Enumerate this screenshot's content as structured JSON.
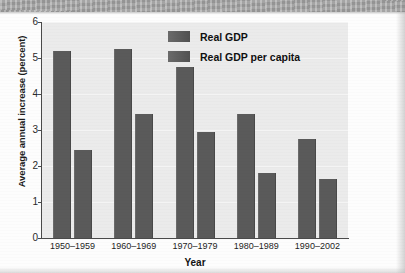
{
  "chart_data": {
    "type": "bar",
    "title": "",
    "xlabel": "Year",
    "ylabel": "Average annual increase (percent)",
    "categories": [
      "1950–1959",
      "1960–1969",
      "1970–1979",
      "1980–1989",
      "1990–2002"
    ],
    "series": [
      {
        "name": "Real GDP",
        "values": [
          5.2,
          5.25,
          4.75,
          3.45,
          2.75
        ],
        "color": "#5a5a5a"
      },
      {
        "name": "Real GDP per capita",
        "values": [
          2.45,
          3.45,
          2.95,
          1.8,
          1.65
        ],
        "color": "#5a5a5a"
      }
    ],
    "ylim": [
      0,
      6
    ],
    "ytick_labels": [
      "6",
      "5",
      "4",
      "3",
      "2",
      "1",
      "0"
    ],
    "ytick_values": [
      6,
      5,
      4,
      3,
      2,
      1,
      0
    ],
    "grid": true,
    "legend_position": "top-center"
  },
  "legend": {
    "entries": [
      {
        "label": "Real GDP"
      },
      {
        "label": "Real GDP per capita"
      }
    ]
  },
  "axes": {
    "y_title": "Average annual increase (percent)",
    "x_title": "Year"
  },
  "colors": {
    "bar": "#5a5a5a",
    "plot_background": "#ebebeb",
    "axis": "#4a4a4a",
    "banner": "#a8a8a8"
  }
}
